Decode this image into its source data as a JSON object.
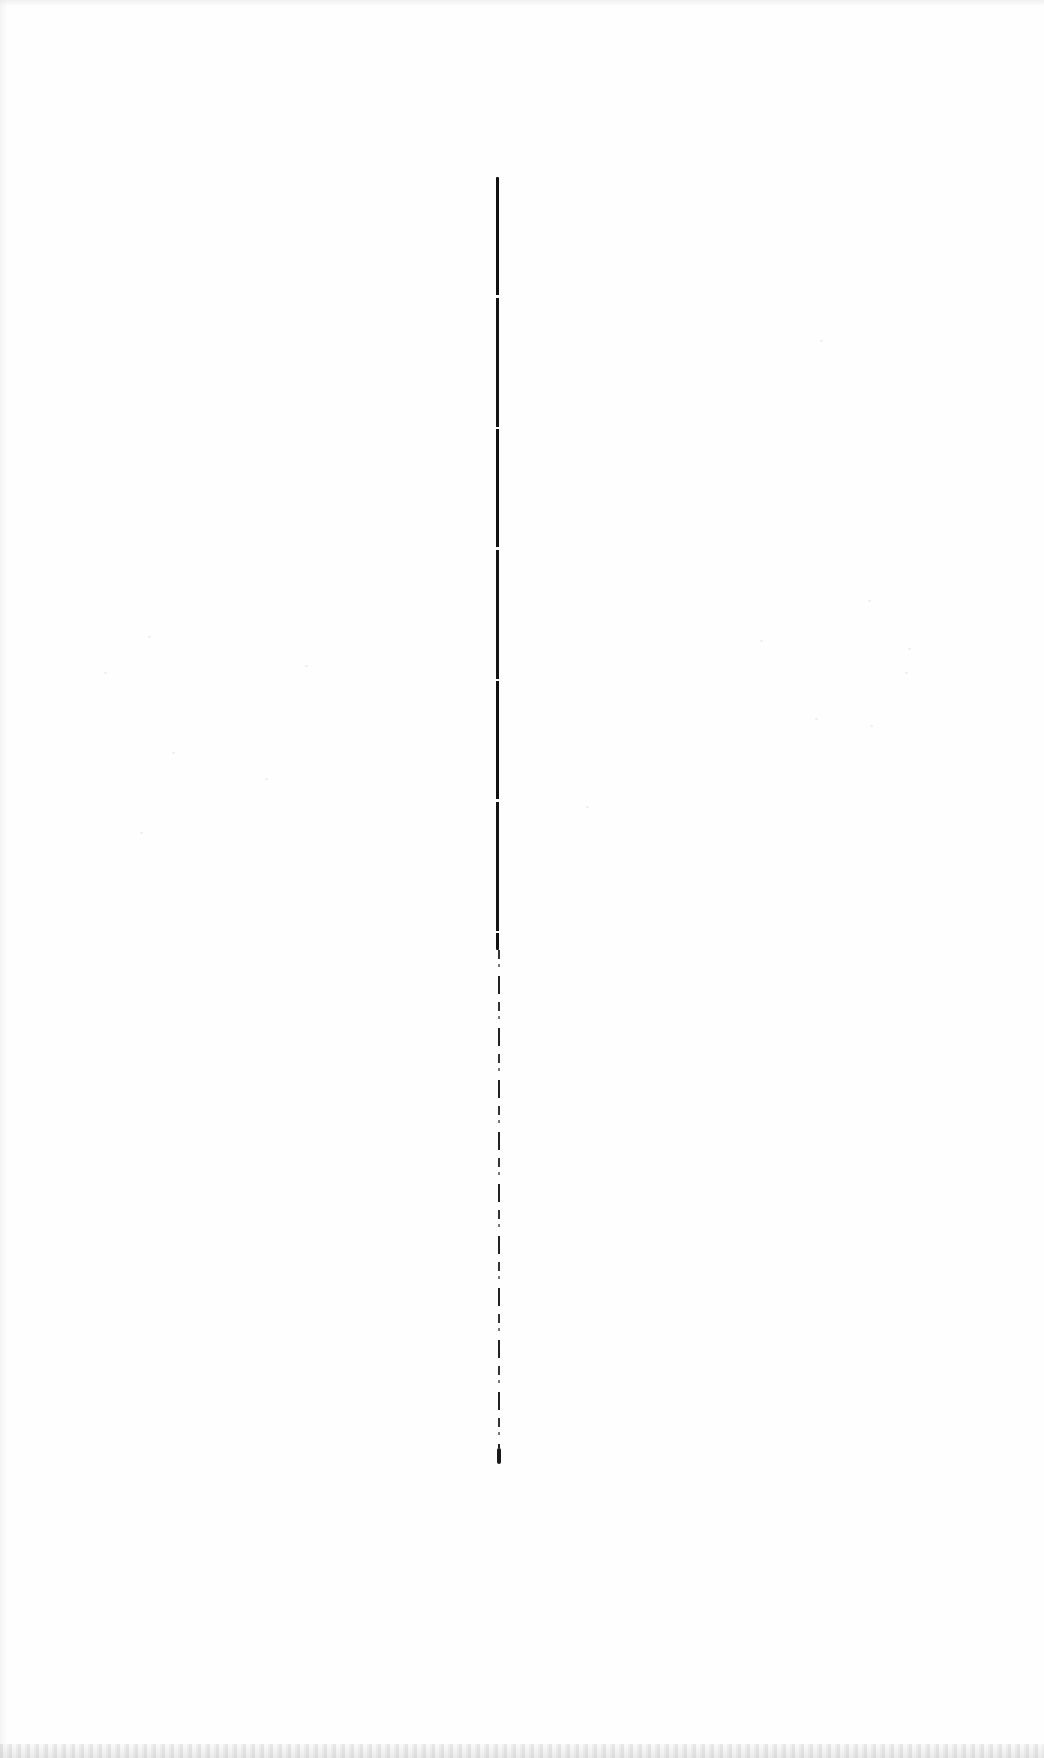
{
  "document": {
    "type": "scanned-blank-page",
    "background_color": "#fefefe",
    "text_content": ""
  },
  "vertical_rule": {
    "color": "#111111",
    "x": 497,
    "solid_segment": {
      "top": 177,
      "bottom": 950
    },
    "broken_segment": {
      "top": 950,
      "bottom": 1448
    },
    "tail_mark": {
      "top": 1448,
      "bottom": 1464
    }
  },
  "scan_artifacts": {
    "bottom_noise_band": true,
    "left_edge_shading": true,
    "bleed_through_speckles": true
  }
}
